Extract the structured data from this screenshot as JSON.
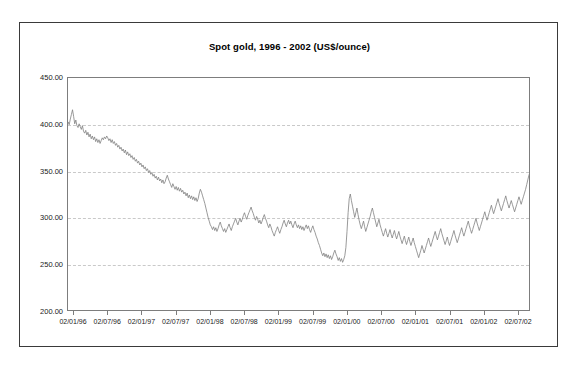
{
  "chart_data": {
    "type": "line",
    "title": "Spot gold, 1996 - 2002 (US$/ounce)",
    "xlabel": "",
    "ylabel": "",
    "ylim": [
      200,
      450
    ],
    "ytick_labels": [
      "450.00",
      "400.00",
      "350.00",
      "300.00",
      "250.00",
      "200.00"
    ],
    "ytick_values": [
      450,
      400,
      350,
      300,
      250,
      200
    ],
    "xtick_labels": [
      "02/01/96",
      "02/07/96",
      "02/01/97",
      "02/07/97",
      "02/01/98",
      "02/07/98",
      "02/01/99",
      "02/07/99",
      "02/01/00",
      "02/07/00",
      "02/01/01",
      "02/07/01",
      "02/01/02",
      "02/07/02"
    ],
    "grid": true,
    "legend": "none",
    "line_color": "#808080",
    "series": [
      {
        "name": "Spot gold",
        "values": [
          398,
          402,
          399,
          405,
          410,
          415,
          408,
          400,
          404,
          398,
          396,
          400,
          397,
          394,
          398,
          392,
          390,
          393,
          388,
          391,
          386,
          389,
          384,
          387,
          383,
          386,
          381,
          384,
          380,
          383,
          379,
          382,
          385,
          383,
          386,
          384,
          387,
          385,
          382,
          384,
          380,
          383,
          379,
          381,
          377,
          379,
          375,
          377,
          373,
          375,
          371,
          373,
          369,
          372,
          367,
          370,
          366,
          368,
          364,
          366,
          362,
          364,
          360,
          362,
          358,
          360,
          356,
          358,
          354,
          356,
          352,
          354,
          350,
          352,
          348,
          350,
          346,
          348,
          344,
          346,
          342,
          344,
          340,
          343,
          339,
          341,
          337,
          340,
          336,
          338,
          342,
          345,
          341,
          338,
          335,
          332,
          336,
          333,
          330,
          333,
          329,
          332,
          328,
          331,
          327,
          329,
          325,
          327,
          323,
          326,
          321,
          324,
          320,
          323,
          319,
          322,
          318,
          321,
          317,
          320,
          326,
          330,
          327,
          323,
          319,
          315,
          310,
          305,
          300,
          296,
          292,
          290,
          287,
          290,
          286,
          289,
          285,
          288,
          292,
          295,
          291,
          288,
          285,
          288,
          284,
          287,
          290,
          293,
          289,
          286,
          290,
          293,
          296,
          299,
          295,
          292,
          296,
          299,
          295,
          298,
          302,
          305,
          301,
          298,
          302,
          305,
          308,
          311,
          307,
          304,
          300,
          297,
          301,
          298,
          294,
          297,
          293,
          296,
          300,
          303,
          299,
          296,
          292,
          289,
          293,
          290,
          286,
          283,
          280,
          284,
          287,
          290,
          286,
          283,
          287,
          290,
          294,
          297,
          293,
          290,
          294,
          297,
          293,
          296,
          292,
          289,
          293,
          296,
          292,
          289,
          292,
          288,
          291,
          287,
          290,
          286,
          289,
          292,
          288,
          291,
          287,
          284,
          288,
          291,
          287,
          284,
          280,
          277,
          273,
          270,
          266,
          262,
          259,
          262,
          258,
          261,
          257,
          260,
          256,
          259,
          255,
          258,
          262,
          265,
          261,
          258,
          254,
          257,
          253,
          256,
          252,
          255,
          259,
          268,
          285,
          305,
          320,
          325,
          318,
          312,
          306,
          300,
          305,
          310,
          303,
          297,
          292,
          288,
          292,
          296,
          290,
          285,
          289,
          293,
          297,
          301,
          306,
          310,
          305,
          300,
          295,
          290,
          294,
          298,
          292,
          288,
          284,
          280,
          284,
          288,
          283,
          279,
          283,
          287,
          282,
          278,
          282,
          286,
          281,
          277,
          281,
          285,
          280,
          276,
          272,
          276,
          280,
          275,
          271,
          275,
          279,
          274,
          270,
          274,
          278,
          273,
          269,
          265,
          261,
          257,
          261,
          265,
          270,
          266,
          262,
          266,
          270,
          274,
          278,
          273,
          269,
          273,
          277,
          281,
          285,
          280,
          276,
          280,
          284,
          288,
          283,
          279,
          275,
          271,
          275,
          279,
          274,
          270,
          274,
          278,
          282,
          286,
          281,
          277,
          273,
          277,
          281,
          285,
          289,
          284,
          280,
          284,
          288,
          292,
          296,
          291,
          287,
          283,
          287,
          291,
          295,
          299,
          294,
          290,
          286,
          290,
          294,
          298,
          302,
          306,
          301,
          297,
          301,
          305,
          309,
          313,
          308,
          304,
          308,
          312,
          316,
          320,
          315,
          311,
          307,
          311,
          315,
          319,
          323,
          318,
          314,
          310,
          314,
          318,
          314,
          310,
          306,
          310,
          314,
          318,
          322,
          318,
          314,
          318,
          322,
          326,
          330,
          335,
          340,
          345,
          348
        ]
      }
    ]
  }
}
